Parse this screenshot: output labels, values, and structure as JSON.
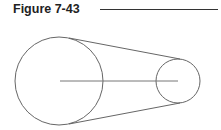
{
  "figure": {
    "title": "Figure 7-43"
  },
  "diagram": {
    "large_pulley": {
      "cx": 59,
      "cy": 81,
      "r": 44
    },
    "small_pulley": {
      "cx": 178,
      "cy": 81,
      "r": 22
    },
    "stroke_color": "#555555"
  }
}
